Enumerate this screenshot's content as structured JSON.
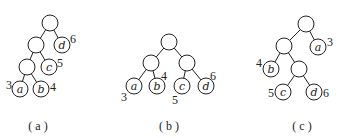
{
  "trees": [
    {
      "caption": "( a )",
      "leaves": [
        {
          "label": "a",
          "weight": "3"
        },
        {
          "label": "b",
          "weight": "4"
        },
        {
          "label": "c",
          "weight": "5"
        },
        {
          "label": "d",
          "weight": "6"
        }
      ]
    },
    {
      "caption": "( b )",
      "leaves": [
        {
          "label": "a",
          "weight": "3"
        },
        {
          "label": "b",
          "weight": "4"
        },
        {
          "label": "c",
          "weight": "5"
        },
        {
          "label": "d",
          "weight": "6"
        }
      ]
    },
    {
      "caption": "( c )",
      "leaves": [
        {
          "label": "a",
          "weight": "3"
        },
        {
          "label": "b",
          "weight": "4"
        },
        {
          "label": "c",
          "weight": "5"
        },
        {
          "label": "d",
          "weight": "6"
        }
      ]
    }
  ]
}
